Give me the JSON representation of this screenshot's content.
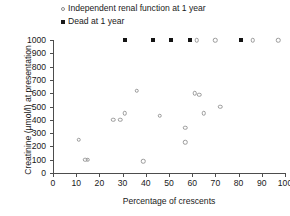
{
  "chart_data": {
    "type": "scatter",
    "title": "",
    "xlabel": "Percentage of crescents",
    "ylabel": "Creatinine (µmol/l) at presentation",
    "xlim": [
      0,
      100
    ],
    "ylim": [
      0,
      1000
    ],
    "xticks": [
      0,
      10,
      20,
      30,
      40,
      50,
      60,
      70,
      80,
      90,
      100
    ],
    "yticks": [
      0,
      100,
      200,
      300,
      400,
      500,
      600,
      700,
      800,
      900,
      1000
    ],
    "grid": false,
    "legend_position": "top-left-above-axes",
    "series": [
      {
        "name": "Independent renal function at 1 year",
        "marker": "open-circle",
        "color": "#9a9a9a",
        "points": [
          [
            11,
            250
          ],
          [
            14,
            100
          ],
          [
            15,
            100
          ],
          [
            26,
            400
          ],
          [
            29,
            400
          ],
          [
            31,
            450
          ],
          [
            36,
            620
          ],
          [
            39,
            90
          ],
          [
            46,
            430
          ],
          [
            57,
            230
          ],
          [
            57,
            340
          ],
          [
            61,
            600
          ],
          [
            63,
            590
          ],
          [
            65,
            450
          ],
          [
            72,
            500
          ],
          [
            62,
            1000
          ],
          [
            70,
            1000
          ],
          [
            86,
            1000
          ],
          [
            97,
            1000
          ]
        ]
      },
      {
        "name": "Dead at 1 year",
        "marker": "filled-square",
        "color": "#141414",
        "points": [
          [
            31,
            1000
          ],
          [
            43,
            1000
          ],
          [
            51,
            1000
          ],
          [
            59,
            1000
          ],
          [
            81,
            1000
          ]
        ]
      }
    ]
  },
  "legend": {
    "items": [
      {
        "label": "Independent renal function at 1 year",
        "marker": "open-circle"
      },
      {
        "label": "Dead at 1 year",
        "marker": "filled-square"
      }
    ]
  }
}
